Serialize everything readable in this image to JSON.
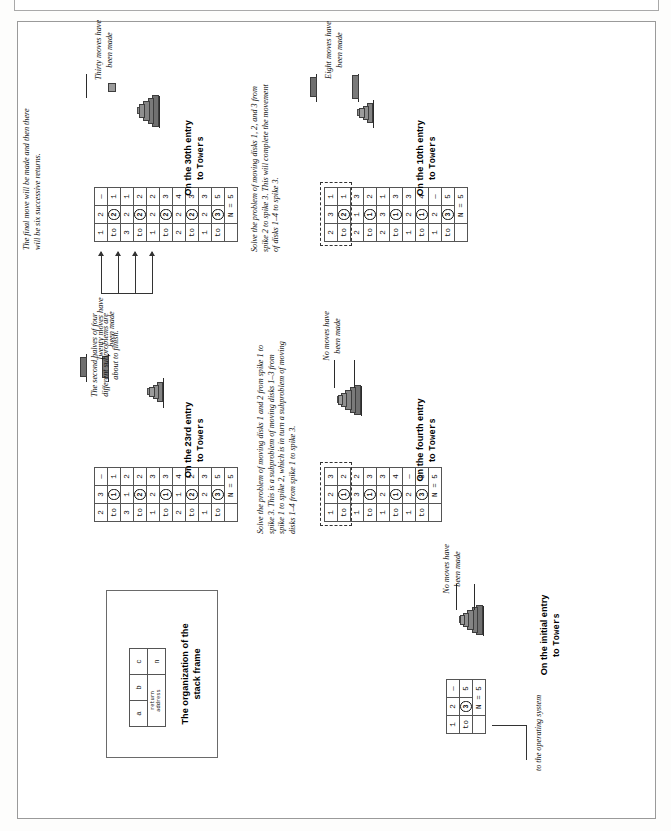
{
  "figure": {
    "title_hidden": "",
    "os_label": "to the operating system",
    "n_label": "N = 5"
  },
  "panels": [
    {
      "id": "initial",
      "caption_line1": "On the initial entry",
      "caption_line2": "to Towers",
      "status": "No moves have\nbeen made",
      "annotation": "",
      "frames": [
        {
          "a": "1",
          "b": "2",
          "c": "—",
          "ret": "to",
          "disk": "3",
          "n": "5"
        }
      ],
      "towers": [
        {
          "disks": []
        },
        {
          "disks": []
        },
        {
          "disks": []
        }
      ]
    },
    {
      "id": "fourth",
      "caption_line1": "On the fourth entry",
      "caption_line2": "to Towers",
      "status": "No moves have\nbeen made",
      "annotation": "Solve the problem of moving disks 1 and 2 from spike 1 to spike 3. This is a subproblem of moving disks 1–3 from spike 1 to spike 2, which is in turn a subproblem of moving disks 1–4 from spike 1 to spike 3.",
      "frames": [
        {
          "a": "1",
          "b": "2",
          "c": "3",
          "ret": "to",
          "disk": "1",
          "n": "2"
        },
        {
          "a": "1",
          "b": "3",
          "c": "2",
          "ret": "to",
          "disk": "1",
          "n": "3"
        },
        {
          "a": "1",
          "b": "2",
          "c": "3",
          "ret": "to",
          "disk": "1",
          "n": "4"
        },
        {
          "a": "1",
          "b": "2",
          "c": "—",
          "ret": "to",
          "disk": "3",
          "n": "5"
        }
      ]
    },
    {
      "id": "tenth",
      "caption_line1": "On the 10th entry",
      "caption_line2": "to Towers",
      "status": "Eight moves have\nbeen made",
      "annotation": "Solve the problem of moving disks 1, 2, and 3 from spike 2 to spike 3. This will complete the movement of disks 1–4 to spike 3.",
      "frames": [
        {
          "a": "2",
          "b": "3",
          "c": "1",
          "ret": "to",
          "disk": "2",
          "n": "1"
        },
        {
          "a": "2",
          "b": "1",
          "c": "3",
          "ret": "to",
          "disk": "1",
          "n": "2"
        },
        {
          "a": "2",
          "b": "3",
          "c": "1",
          "ret": "to",
          "disk": "1",
          "n": "3"
        },
        {
          "a": "1",
          "b": "2",
          "c": "3",
          "ret": "to",
          "disk": "1",
          "n": "4"
        },
        {
          "a": "1",
          "b": "2",
          "c": "—",
          "ret": "to",
          "disk": "3",
          "n": "5"
        }
      ]
    },
    {
      "id": "twentythird",
      "caption_line1": "On the 23rd entry",
      "caption_line2": "to Towers",
      "status": "Twenty moves have\nbeen made",
      "annotation": "",
      "frames": [
        {
          "a": "2",
          "b": "3",
          "c": "—",
          "ret": "to",
          "disk": "1",
          "n": "1"
        },
        {
          "a": "3",
          "b": "1",
          "c": "2",
          "ret": "to",
          "disk": "2",
          "n": "2"
        },
        {
          "a": "1",
          "b": "2",
          "c": "3",
          "ret": "to",
          "disk": "1",
          "n": "3"
        },
        {
          "a": "2",
          "b": "1",
          "c": "4",
          "ret": "to",
          "disk": "2",
          "n": "2"
        },
        {
          "a": "1",
          "b": "2",
          "c": "3",
          "ret": "to",
          "disk": "3",
          "n": "5"
        }
      ]
    },
    {
      "id": "thirtieth",
      "caption_line1": "On the 30th entry",
      "caption_line2": "to Towers",
      "status": "Thirty moves have\nbeen made",
      "annotation": "The final move will be made and then there will be six successive returns.",
      "frames": [
        {
          "a": "1",
          "b": "2",
          "c": "—",
          "ret": "to",
          "disk": "2",
          "n": "1"
        },
        {
          "a": "3",
          "b": "2",
          "c": "1",
          "ret": "to",
          "disk": "2",
          "n": "2"
        },
        {
          "a": "1",
          "b": "2",
          "c": "2",
          "ret": "to",
          "disk": "2",
          "n": "3"
        },
        {
          "a": "2",
          "b": "2",
          "c": "4",
          "ret": "to",
          "disk": "2",
          "n": "3"
        },
        {
          "a": "1",
          "b": "2",
          "c": "3",
          "ret": "to",
          "disk": "3",
          "n": "5"
        }
      ]
    }
  ],
  "middle_note": "The second halves of four different subproblems are about to finish.",
  "org": {
    "title_line1": "The organization of the",
    "title_line2": "stack frame",
    "cells": {
      "a": "a",
      "b": "b",
      "c": "c",
      "return_address": "return\naddress",
      "n": "n"
    }
  },
  "colors": {
    "ink": "#111111",
    "rule": "#555555",
    "disk": "#8a8a8a",
    "post": "#8f8f8f",
    "page": "#ffffff"
  }
}
